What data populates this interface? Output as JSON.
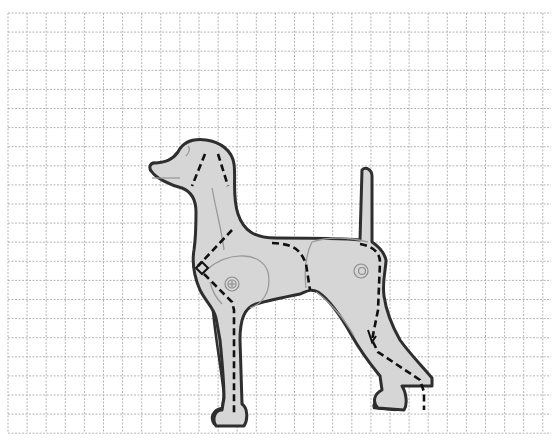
{
  "diagram": {
    "colors": {
      "background": "#ffffff",
      "grid": "#b5b5b5",
      "body_fill": "#d6d6d6",
      "outline": "#2e2e2e",
      "dashed": "#111111",
      "detail": "#9a9a9a"
    },
    "grid": {
      "x0": 8,
      "y0": 13,
      "x1": 551,
      "y1": 433,
      "spacing": 19.1
    },
    "parts": [
      {
        "id": "head",
        "label": "head"
      },
      {
        "id": "neck",
        "label": "neck"
      },
      {
        "id": "torso",
        "label": "torso"
      },
      {
        "id": "tail",
        "label": "tail"
      },
      {
        "id": "front-leg-left",
        "label": "front leg"
      },
      {
        "id": "front-leg-right",
        "label": "front leg"
      },
      {
        "id": "hind-leg-left",
        "label": "hind leg"
      },
      {
        "id": "hind-leg-right",
        "label": "hind leg"
      },
      {
        "id": "shoulder-joint",
        "label": "shoulder joint"
      },
      {
        "id": "hip-joint",
        "label": "hip joint"
      }
    ]
  }
}
